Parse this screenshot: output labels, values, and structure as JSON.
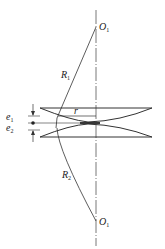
{
  "diagram": {
    "labels": {
      "center_top": "O",
      "center_top_sub": "1",
      "center_bottom": "O",
      "center_bottom_sub": "1",
      "radius_top": "R",
      "radius_top_sub": "1",
      "radius_bottom": "R",
      "radius_bottom_sub": "2",
      "radius_r": "r",
      "e1": "e",
      "e1_sub": "1",
      "e2": "e",
      "e2_sub": "2"
    },
    "colors": {
      "line": "#333333",
      "background": "#ffffff"
    }
  }
}
